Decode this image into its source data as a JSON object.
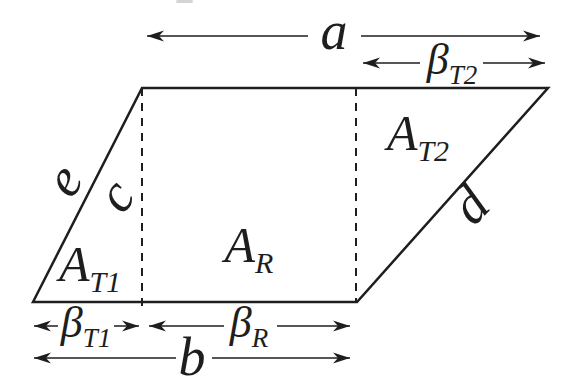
{
  "figure": {
    "background_color": "#ffffff",
    "line_color": "#1e1e1e",
    "artifact_color": "#c6c6c6",
    "side_labels": {
      "left_slant": "e",
      "height_dashed": "c",
      "right_slant": "d"
    },
    "dimension_arrows": {
      "a": {
        "label": "a"
      },
      "b": {
        "label": "b"
      },
      "beta_t2": {
        "symbol": "β",
        "sub": "T2"
      },
      "beta_t1": {
        "symbol": "β",
        "sub": "T1"
      },
      "beta_r": {
        "symbol": "β",
        "sub": "R"
      }
    },
    "area_labels": {
      "triangle_1": {
        "symbol": "A",
        "sub": "T1"
      },
      "rectangle": {
        "symbol": "A",
        "sub": "R"
      },
      "triangle_2": {
        "symbol": "A",
        "sub": "T2"
      }
    }
  }
}
